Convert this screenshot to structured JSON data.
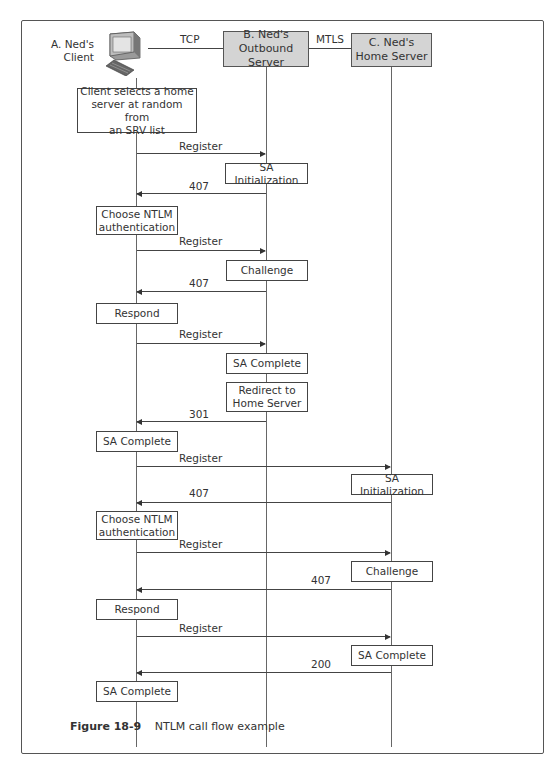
{
  "participants": {
    "a": {
      "label": "A. Ned's\nClient",
      "line1": "A. Ned's",
      "line2": "Client",
      "icon": "computer-icon"
    },
    "b": {
      "label": "B. Ned's\nOutbound Server"
    },
    "c": {
      "label": "C. Ned's\nHome Server"
    }
  },
  "connections": {
    "a_b": "TCP",
    "b_c": "MTLS"
  },
  "notes": {
    "client_select": "Client selects a home\nserver at random from\nan SRV list",
    "b_sa_init": "SA Initialization",
    "a_choose_ntlm_1": "Choose NTLM\nauthentication",
    "b_challenge": "Challenge",
    "a_respond_1": "Respond",
    "b_sa_complete": "SA Complete",
    "b_redirect": "Redirect to\nHome Server",
    "a_sa_complete_1": "SA Complete",
    "c_sa_init": "SA Initialization",
    "a_choose_ntlm_2": "Choose NTLM\nauthentication",
    "c_challenge": "Challenge",
    "a_respond_2": "Respond",
    "c_sa_complete": "SA Complete",
    "a_sa_complete_2": "SA Complete"
  },
  "messages": [
    {
      "from": "A",
      "to": "B",
      "label": "Register"
    },
    {
      "from": "B",
      "to": "A",
      "label": "407"
    },
    {
      "from": "A",
      "to": "B",
      "label": "Register"
    },
    {
      "from": "B",
      "to": "A",
      "label": "407"
    },
    {
      "from": "A",
      "to": "B",
      "label": "Register"
    },
    {
      "from": "B",
      "to": "A",
      "label": "301"
    },
    {
      "from": "A",
      "to": "C",
      "label": "Register"
    },
    {
      "from": "C",
      "to": "A",
      "label": "407"
    },
    {
      "from": "A",
      "to": "C",
      "label": "Register"
    },
    {
      "from": "C",
      "to": "A",
      "label": "407"
    },
    {
      "from": "A",
      "to": "C",
      "label": "Register"
    },
    {
      "from": "C",
      "to": "A",
      "label": "200"
    }
  ],
  "caption": {
    "number": "Figure 18-9",
    "title": "NTLM call flow example"
  }
}
